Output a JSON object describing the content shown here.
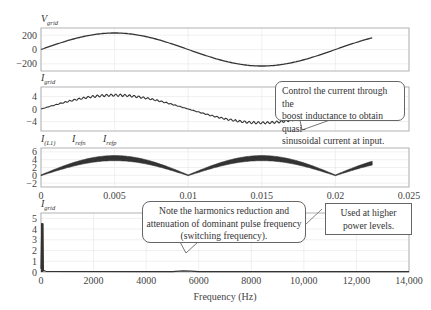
{
  "chart_data": [
    {
      "type": "line",
      "title": "",
      "ylabel": "V_grid",
      "ylabel_main": "V",
      "ylabel_sub": "grid",
      "xlabel": "",
      "xlim": [
        0,
        0.025
      ],
      "ylim": [
        -300,
        300
      ],
      "yticks": [
        200,
        0,
        -200
      ],
      "ytick_labels": [
        "200",
        "0",
        "−200"
      ],
      "grid": true,
      "series": [
        {
          "name": "V_grid",
          "description": "sinusoid amplitude ~230 V, 50 Hz, from t=0 to t≈0.0225",
          "x": [
            0,
            0.0025,
            0.005,
            0.0075,
            0.01,
            0.0125,
            0.015,
            0.0175,
            0.02,
            0.0225
          ],
          "y": [
            0,
            163,
            230,
            163,
            0,
            -163,
            -230,
            -163,
            0,
            163
          ]
        }
      ]
    },
    {
      "type": "line",
      "ylabel": "I_grid",
      "ylabel_main": "I",
      "ylabel_sub": "grid",
      "xlim": [
        0,
        0.025
      ],
      "ylim": [
        -7,
        7
      ],
      "yticks": [
        4,
        0,
        -4
      ],
      "ytick_labels": [
        "4",
        "0",
        "−4"
      ],
      "grid": true,
      "series": [
        {
          "name": "I_grid",
          "description": "quasi-sinusoidal current with switching ripple, amplitude ~4.5 A",
          "x": [
            0,
            0.0025,
            0.005,
            0.0075,
            0.01,
            0.0125,
            0.015,
            0.0175
          ],
          "y": [
            0,
            3.2,
            4.5,
            3.2,
            0,
            -3.2,
            -4.5,
            -3.2
          ]
        }
      ]
    },
    {
      "type": "line",
      "ylabel": "I_(L1), I_refn, I_refp",
      "legend": [
        {
          "main": "I",
          "sub": "(L1)"
        },
        {
          "main": "I",
          "sub": "refn"
        },
        {
          "main": "I",
          "sub": "refp"
        }
      ],
      "xlabel": "",
      "xlim": [
        0,
        0.025
      ],
      "xticks": [
        0,
        0.005,
        0.01,
        0.015,
        0.02,
        0.025
      ],
      "xtick_labels": [
        "0",
        "0.005",
        "0.01",
        "0.015",
        "0.02",
        "0.025"
      ],
      "ylim": [
        -3,
        7
      ],
      "yticks": [
        6,
        4,
        2,
        0,
        -2
      ],
      "ytick_labels": [
        "6",
        "4",
        "2",
        "0",
        "−2"
      ],
      "grid": true,
      "series": [
        {
          "name": "I_(L1)",
          "description": "rectified sinusoid with ripple band, peak ~4.5 A",
          "x": [
            0,
            0.0025,
            0.005,
            0.0075,
            0.01,
            0.0125,
            0.015,
            0.0175,
            0.02,
            0.0225
          ],
          "y": [
            0,
            3.2,
            4.5,
            3.2,
            0,
            3.2,
            4.5,
            3.2,
            0,
            3.2
          ]
        }
      ]
    },
    {
      "type": "line",
      "ylabel": "I_grid",
      "ylabel_main": "I",
      "ylabel_sub": "grid",
      "xlabel": "Frequency (Hz)",
      "xlim": [
        0,
        14000
      ],
      "xticks": [
        0,
        2000,
        4000,
        6000,
        8000,
        10000,
        12000,
        14000
      ],
      "xtick_labels": [
        "0",
        "2000",
        "4000",
        "6000",
        "8000",
        "10,000",
        "12,000",
        "14,000"
      ],
      "ylim": [
        0,
        5.5
      ],
      "yticks": [
        5,
        4,
        3,
        2,
        1,
        0
      ],
      "ytick_labels": [
        "5",
        "4",
        "3",
        "2",
        "1",
        "0"
      ],
      "grid": true,
      "series": [
        {
          "name": "I_grid spectrum",
          "description": "fundamental spike ~4.5 at 50 Hz, near-zero elsewhere",
          "x": [
            0,
            50,
            100,
            2000,
            5500,
            14000
          ],
          "y": [
            0.2,
            4.5,
            0.1,
            0.05,
            0.1,
            0.05
          ]
        }
      ]
    }
  ],
  "annotations": {
    "callout_control": "Control the current through the boost inductance to obtain quasi-sinusoidal current at input.",
    "callout_control_lines": [
      "Control the current through the",
      "boost inductance to obtain quasi-",
      "sinusoidal current at input."
    ],
    "callout_harmonics_lines": [
      "Note the harmonics reduction and",
      "attenuation of dominant pulse frequency",
      "(switching frequency)."
    ],
    "callout_power_lines": [
      "Used at higher",
      "power levels."
    ]
  },
  "colors": {
    "trace": "#333333",
    "frame": "#aaaaaa",
    "grid": "#e6e6e6",
    "text": "#333333"
  }
}
